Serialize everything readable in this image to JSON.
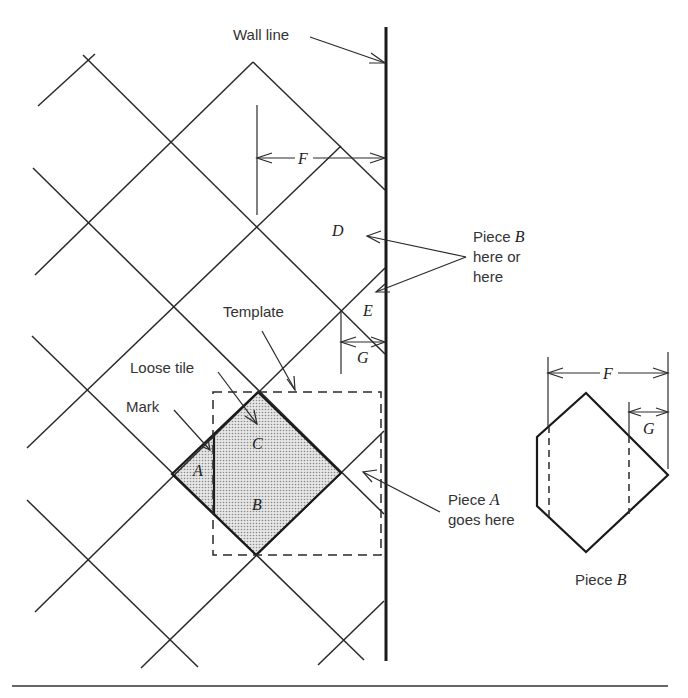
{
  "diagram": {
    "labels": {
      "wall_line": "Wall line",
      "F": "F",
      "D": "D",
      "E": "E",
      "G": "G",
      "piece_b_here_1": "Piece ",
      "piece_b_here_letter": "B",
      "piece_b_here_2": "here or",
      "piece_b_here_3": "here",
      "template": "Template",
      "loose_tile": "Loose tile",
      "mark": "Mark",
      "A": "A",
      "B": "B",
      "C": "C",
      "piece_a_goes_1": "Piece ",
      "piece_a_letter": "A",
      "piece_a_goes_2": "goes here",
      "piece_b_caption": "Piece ",
      "piece_b_caption_letter": "B",
      "detail_F": "F",
      "detail_G": "G"
    },
    "colors": {
      "line": "#2a2a2a",
      "wall": "#1a1a1a",
      "shade": "#d8d8d8",
      "background": "#ffffff"
    }
  }
}
